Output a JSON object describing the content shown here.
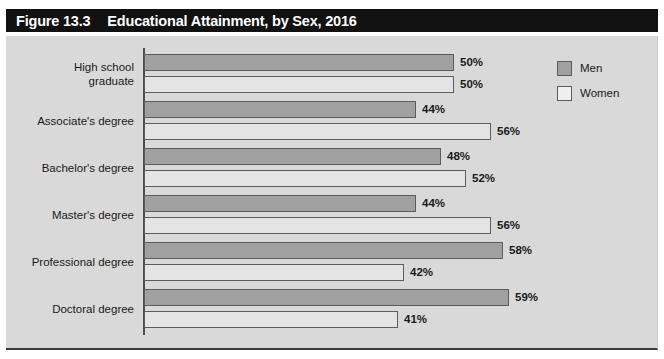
{
  "figure": {
    "number": "Figure 13.3",
    "title": "Educational Attainment, by Sex, 2016"
  },
  "legend": {
    "items": [
      {
        "label": "Men",
        "swatch": "men-swatch",
        "color": "#a0a0a0"
      },
      {
        "label": "Women",
        "swatch": "women-swatch",
        "color": "#efefef"
      }
    ]
  },
  "colors": {
    "banner": "#111111",
    "panel": "#d9d9d9",
    "men_bar": "#a0a0a0",
    "women_bar": "#e4e4e4",
    "bar_border": "#5c5c5c",
    "axis": "#4d4d4d"
  },
  "chart_data": {
    "type": "bar",
    "orientation": "horizontal",
    "title": "Educational Attainment, by Sex, 2016",
    "xlabel": "",
    "ylabel": "",
    "xlim": [
      0,
      60
    ],
    "grid": false,
    "legend_position": "top-right",
    "value_suffix": "%",
    "categories": [
      "High school graduate",
      "Associate's degree",
      "Bachelor's degree",
      "Master's degree",
      "Professional degree",
      "Doctoral degree"
    ],
    "category_lines": [
      [
        "High school",
        "graduate"
      ],
      [
        "Associate's degree"
      ],
      [
        "Bachelor's degree"
      ],
      [
        "Master's degree"
      ],
      [
        "Professional degree"
      ],
      [
        "Doctoral degree"
      ]
    ],
    "series": [
      {
        "name": "Men",
        "values": [
          50,
          44,
          48,
          44,
          58,
          59
        ],
        "labels": [
          "50%",
          "44%",
          "48%",
          "44%",
          "58%",
          "59%"
        ]
      },
      {
        "name": "Women",
        "values": [
          50,
          56,
          52,
          56,
          42,
          41
        ],
        "labels": [
          "50%",
          "56%",
          "52%",
          "56%",
          "42%",
          "41%"
        ]
      }
    ]
  }
}
